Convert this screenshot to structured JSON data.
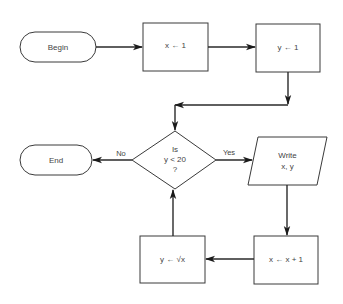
{
  "diagram": {
    "type": "flowchart",
    "nodes": {
      "begin": {
        "label": "Begin",
        "shape": "terminal"
      },
      "init_x": {
        "label": "x ← 1",
        "shape": "process"
      },
      "init_y": {
        "label": "y ← 1",
        "shape": "process"
      },
      "decision": {
        "line1": "Is",
        "line2": "y < 20",
        "line3": "?",
        "shape": "decision"
      },
      "end": {
        "label": "End",
        "shape": "terminal"
      },
      "write": {
        "line1": "Write",
        "line2": "x, y",
        "shape": "io"
      },
      "increment_x": {
        "label": "x ← x + 1",
        "shape": "process"
      },
      "update_y": {
        "label": "y ← √x",
        "shape": "process"
      }
    },
    "edges": [
      {
        "from": "begin",
        "to": "init_x",
        "label": ""
      },
      {
        "from": "init_x",
        "to": "init_y",
        "label": ""
      },
      {
        "from": "init_y",
        "to": "decision",
        "label": ""
      },
      {
        "from": "decision",
        "to": "end",
        "label": "No"
      },
      {
        "from": "decision",
        "to": "write",
        "label": "Yes"
      },
      {
        "from": "write",
        "to": "increment_x",
        "label": ""
      },
      {
        "from": "increment_x",
        "to": "update_y",
        "label": ""
      },
      {
        "from": "update_y",
        "to": "decision",
        "label": ""
      }
    ],
    "edge_labels": {
      "no": "No",
      "yes": "Yes"
    },
    "colors": {
      "stroke": "#3a3a3a",
      "text": "#444444",
      "background": "#ffffff"
    }
  }
}
